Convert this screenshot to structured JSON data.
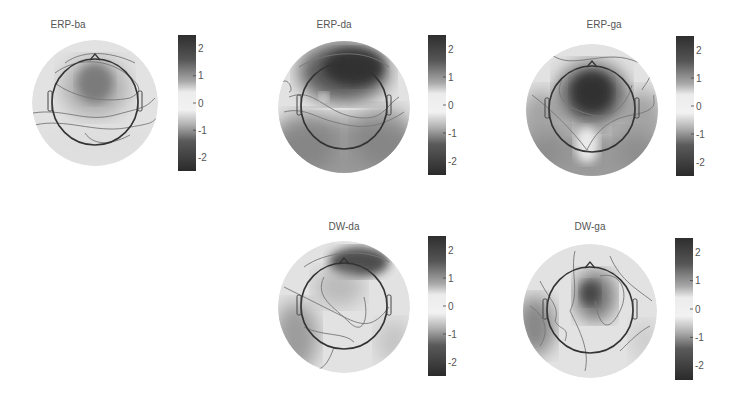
{
  "chart_data": [
    {
      "type": "heatmap",
      "subtype": "scalp-topography",
      "title": "ERP-ba",
      "colorbar": {
        "ticks": [
          "2",
          "1",
          "0",
          "-1",
          "-2"
        ],
        "range": [
          -2.5,
          2.5
        ]
      },
      "description": "moderate positive fronto-central maximum (~1.5), near-zero elsewhere",
      "peaks": [
        {
          "region": "frontal-central",
          "value": 1.6
        }
      ],
      "troughs": []
    },
    {
      "type": "heatmap",
      "subtype": "scalp-topography",
      "title": "ERP-da",
      "colorbar": {
        "ticks": [
          "2",
          "1",
          "0",
          "-1",
          "-2"
        ],
        "range": [
          -2.5,
          2.5
        ]
      },
      "description": "strong frontal positivity (~2.3), strong posterior negativity (~-1.8)",
      "peaks": [
        {
          "region": "frontal",
          "value": 2.3
        }
      ],
      "troughs": [
        {
          "region": "posterior",
          "value": -1.8
        }
      ]
    },
    {
      "type": "heatmap",
      "subtype": "scalp-topography",
      "title": "ERP-ga",
      "colorbar": {
        "ticks": [
          "2",
          "1",
          "0",
          "-1",
          "-2"
        ],
        "range": [
          -2.5,
          2.5
        ]
      },
      "description": "strong fronto-central positivity (~2.4), posterior negativity (~-1.6)",
      "peaks": [
        {
          "region": "fronto-central",
          "value": 2.4
        }
      ],
      "troughs": [
        {
          "region": "posterior",
          "value": -1.6
        }
      ]
    },
    {
      "type": "heatmap",
      "subtype": "scalp-topography",
      "title": "DW-da",
      "colorbar": {
        "ticks": [
          "2",
          "1",
          "0",
          "-1",
          "-2"
        ],
        "range": [
          -2.5,
          2.5
        ]
      },
      "description": "frontal-right positivity (~2.0), left posterior negativity (~-1.2)",
      "peaks": [
        {
          "region": "frontal-right",
          "value": 2.0
        }
      ],
      "troughs": [
        {
          "region": "left-posterior",
          "value": -1.2
        },
        {
          "region": "right-posterior",
          "value": -0.7
        }
      ]
    },
    {
      "type": "heatmap",
      "subtype": "scalp-topography",
      "title": "DW-ga",
      "colorbar": {
        "ticks": [
          "2",
          "1",
          "0",
          "-1",
          "-2"
        ],
        "range": [
          -2.5,
          2.5
        ]
      },
      "description": "central-right positivity (~1.8), left temporal negativity (~-1.4)",
      "peaks": [
        {
          "region": "central-right",
          "value": 1.8
        }
      ],
      "troughs": [
        {
          "region": "left-temporal",
          "value": -1.4
        }
      ]
    }
  ]
}
